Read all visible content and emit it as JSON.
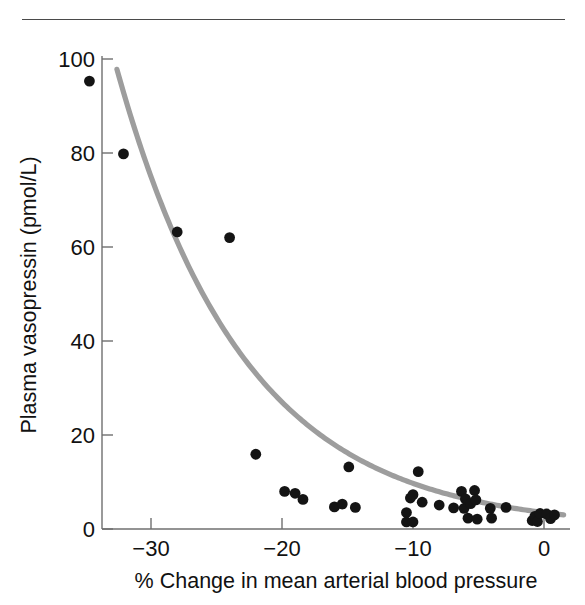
{
  "figure": {
    "has_top_rule": true,
    "background_color": "#ffffff"
  },
  "chart_data": {
    "type": "scatter",
    "title": "",
    "xlabel": "% Change in mean arterial blood pressure",
    "ylabel": "Plasma vasopressin (pmol/L)",
    "xlim": [
      -35.5,
      2.0
    ],
    "ylim": [
      0,
      103
    ],
    "xticks": [
      -30,
      -20,
      -10,
      0
    ],
    "xticklabels": [
      "−30",
      "−20",
      "−10",
      "0"
    ],
    "yticks": [
      0,
      20,
      40,
      60,
      80,
      100
    ],
    "yticklabels": [
      "0",
      "20",
      "40",
      "60",
      "80",
      "100"
    ],
    "grid": false,
    "legend": null,
    "marker_color": "#141414",
    "marker_size": 5.4,
    "curve_color": "#9d9d9d",
    "points": [
      {
        "x": -34.7,
        "y": 95.3
      },
      {
        "x": -32.1,
        "y": 79.8
      },
      {
        "x": -28.0,
        "y": 63.2
      },
      {
        "x": -24.0,
        "y": 62.0
      },
      {
        "x": -22.0,
        "y": 15.9
      },
      {
        "x": -19.8,
        "y": 8.0
      },
      {
        "x": -19.0,
        "y": 7.6
      },
      {
        "x": -18.4,
        "y": 6.3
      },
      {
        "x": -16.0,
        "y": 4.7
      },
      {
        "x": -15.4,
        "y": 5.3
      },
      {
        "x": -14.9,
        "y": 13.2
      },
      {
        "x": -14.4,
        "y": 4.6
      },
      {
        "x": -10.5,
        "y": 3.5
      },
      {
        "x": -10.5,
        "y": 1.5
      },
      {
        "x": -10.2,
        "y": 6.6
      },
      {
        "x": -10.0,
        "y": 7.3
      },
      {
        "x": -10.0,
        "y": 1.5
      },
      {
        "x": -9.6,
        "y": 12.2
      },
      {
        "x": -9.3,
        "y": 5.7
      },
      {
        "x": -8.0,
        "y": 5.1
      },
      {
        "x": -6.9,
        "y": 4.5
      },
      {
        "x": -6.3,
        "y": 8.0
      },
      {
        "x": -6.1,
        "y": 4.4
      },
      {
        "x": -6.0,
        "y": 6.4
      },
      {
        "x": -5.8,
        "y": 2.3
      },
      {
        "x": -5.6,
        "y": 5.4
      },
      {
        "x": -5.3,
        "y": 8.2
      },
      {
        "x": -5.2,
        "y": 6.2
      },
      {
        "x": -5.1,
        "y": 2.1
      },
      {
        "x": -4.1,
        "y": 4.4
      },
      {
        "x": -4.0,
        "y": 2.3
      },
      {
        "x": -2.9,
        "y": 4.6
      },
      {
        "x": -0.9,
        "y": 1.8
      },
      {
        "x": -0.7,
        "y": 2.7
      },
      {
        "x": -0.5,
        "y": 1.6
      },
      {
        "x": -0.3,
        "y": 3.3
      },
      {
        "x": 0.2,
        "y": 3.2
      },
      {
        "x": 0.5,
        "y": 2.2
      },
      {
        "x": 0.8,
        "y": 3.0
      }
    ],
    "fit_curve": {
      "description": "exponential decay fit through scatter",
      "x_start": -32.6,
      "x_end": 1.5,
      "y_start": 97.8,
      "y_end": 3.0
    }
  }
}
